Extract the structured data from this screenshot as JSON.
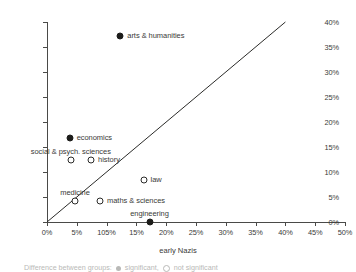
{
  "chart_data": {
    "type": "scatter",
    "title": "",
    "xlabel": "early Nazis",
    "ylabel": "Spartakisten",
    "xlim": [
      0,
      50
    ],
    "ylim": [
      0,
      40
    ],
    "grid": false,
    "legend_position": "below-plot",
    "x_tick_labels": [
      "0%",
      "5%",
      "105%",
      "15%",
      "20%",
      "25%",
      "30%",
      "35%",
      "40%",
      "45%",
      "50%"
    ],
    "x_tick_values": [
      0,
      5,
      10,
      15,
      20,
      25,
      30,
      35,
      40,
      45,
      50
    ],
    "y_tick_labels": [
      "0%",
      "5%",
      "10%",
      "15%",
      "20%",
      "25%",
      "30%",
      "35%",
      "40%"
    ],
    "y_tick_values": [
      0,
      5,
      10,
      15,
      20,
      25,
      30,
      35,
      40
    ],
    "reference_line": {
      "from": [
        0,
        0
      ],
      "to": [
        40,
        40
      ],
      "note": "diagonal y = x"
    },
    "points": [
      {
        "label": "arts & humanities",
        "x": 12.3,
        "y": 37.3,
        "marker": "filled",
        "label_pos": "right"
      },
      {
        "label": "economics",
        "x": 3.8,
        "y": 16.9,
        "marker": "filled",
        "label_pos": "right"
      },
      {
        "label": "social & psych. sciences",
        "x": 4.0,
        "y": 12.5,
        "marker": "open",
        "label_pos": "above"
      },
      {
        "label": "history",
        "x": 7.4,
        "y": 12.5,
        "marker": "open",
        "label_pos": "right"
      },
      {
        "label": "law",
        "x": 16.2,
        "y": 8.5,
        "marker": "open",
        "label_pos": "right"
      },
      {
        "label": "medicine",
        "x": 4.7,
        "y": 4.3,
        "marker": "open",
        "label_pos": "above"
      },
      {
        "label": "maths & sciences",
        "x": 8.9,
        "y": 4.3,
        "marker": "open",
        "label_pos": "right"
      },
      {
        "label": "engineering",
        "x": 17.2,
        "y": 0.0,
        "marker": "filled",
        "label_pos": "above"
      }
    ]
  },
  "caption": {
    "text_before": "Difference between groups:",
    "significant": "significant,",
    "not_significant": "not significant"
  }
}
